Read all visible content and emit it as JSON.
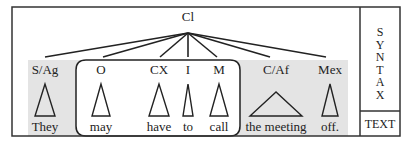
{
  "root": {
    "label": "Cl",
    "x": 188,
    "y": 21,
    "apex_y": 33
  },
  "side_panel": {
    "syntax_letters": [
      "S",
      "Y",
      "N",
      "T",
      "A",
      "X"
    ],
    "text_label": "TEXT"
  },
  "nodes": [
    {
      "label": "S/Ag",
      "word": "They",
      "x": 45,
      "tri_half": 10,
      "attach_x": 45
    },
    {
      "label": "O",
      "word": "may",
      "x": 101,
      "tri_half": 9,
      "attach_x": 103
    },
    {
      "label": "CX",
      "word": "have",
      "x": 159,
      "tri_half": 10,
      "attach_x": 160
    },
    {
      "label": "I",
      "word": "to",
      "x": 188,
      "tri_half": 5,
      "attach_x": 188
    },
    {
      "label": "M",
      "word": "call",
      "x": 219,
      "tri_half": 9,
      "attach_x": 217
    },
    {
      "label": "C/Af",
      "word": "the meeting",
      "x": 276,
      "tri_half": 26,
      "attach_x": 270
    },
    {
      "label": "Mex",
      "word": "off.",
      "x": 330,
      "tri_half": 8,
      "attach_x": 326
    }
  ],
  "colors": {
    "shade": "#e4e4e4",
    "line": "#222222",
    "frame": "#333333"
  }
}
